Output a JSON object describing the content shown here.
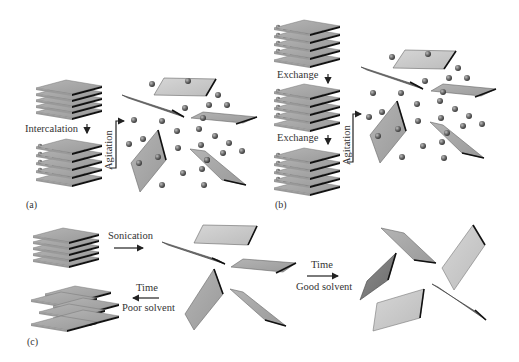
{
  "figure": {
    "panels": [
      {
        "id": "a",
        "label": "(a)",
        "steps": [
          "Intercalation",
          "Agitation"
        ]
      },
      {
        "id": "b",
        "label": "(b)",
        "steps": [
          "Exchange",
          "Exchange",
          "Agitation"
        ]
      },
      {
        "id": "c",
        "label": "(c)",
        "steps": [
          "Sonication",
          "Time",
          "Good solvent",
          "Time",
          "Poor solvent"
        ]
      }
    ],
    "labels": {
      "panel_a": "(a)",
      "panel_b": "(b)",
      "panel_c": "(c)",
      "intercalation": "Intercalation",
      "agitation_a": "Agitation",
      "exchange_1": "Exchange",
      "exchange_2": "Exchange",
      "agitation_b": "Agitation",
      "sonication": "Sonication",
      "time_good": "Time",
      "good_solvent": "Good solvent",
      "time_poor": "Time",
      "poor_solvent": "Poor solvent"
    },
    "colors": {
      "sheet_light": "#c8c8c8",
      "sheet_mid": "#a8a8a8",
      "sheet_dark": "#7a7a7a",
      "edge": "#1a1a1a",
      "sphere": "#6a6a6a",
      "text": "#333333"
    }
  }
}
